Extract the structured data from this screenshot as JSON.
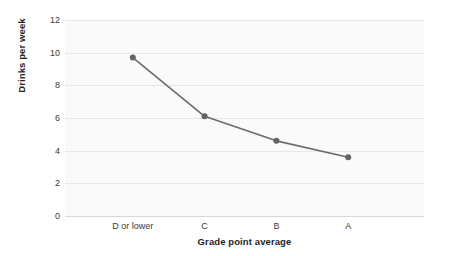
{
  "chart_data": {
    "type": "line",
    "title": "",
    "xlabel": "Grade point average",
    "ylabel": "Drinks per week",
    "categories": [
      "D or lower",
      "C",
      "B",
      "A"
    ],
    "values": [
      9.7,
      6.1,
      4.6,
      3.6
    ],
    "series": [
      {
        "name": "Drinks per week",
        "values": [
          9.7,
          6.1,
          4.6,
          3.6
        ]
      }
    ],
    "ylim": [
      0,
      12
    ],
    "y_ticks": [
      0,
      2,
      4,
      6,
      8,
      10,
      12
    ],
    "y_tick_labels": [
      "0",
      "2",
      "4",
      "6",
      "8",
      "10",
      "12"
    ],
    "x_tick_labels": [
      "D or lower",
      "C",
      "B",
      "A"
    ],
    "grid": "horizontal",
    "legend": "none",
    "line_color": "#6b6b6b",
    "marker_color": "#636363",
    "plot_background": "#fafafa",
    "gridline_color": "#e8e8e8"
  }
}
